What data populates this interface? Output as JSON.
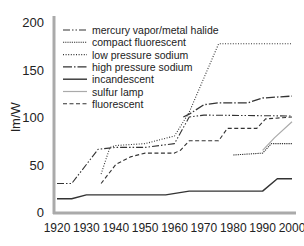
{
  "chart_data": {
    "type": "line",
    "title": "",
    "xlabel": "",
    "ylabel": "lm/W",
    "xlim": [
      1920,
      2000
    ],
    "ylim": [
      0,
      200
    ],
    "x_ticks": [
      1920,
      1930,
      1940,
      1950,
      1960,
      1970,
      1980,
      1990,
      2000
    ],
    "y_ticks": [
      0,
      50,
      100,
      150,
      200
    ],
    "grid": false,
    "legend_position": "upper left",
    "series": [
      {
        "name": "mercury vapor/metal halide",
        "style": "dashdot",
        "color": "#333333",
        "x": [
          1920,
          1925,
          1930,
          1934,
          1940,
          1950,
          1955,
          1960,
          1965,
          1970,
          2000
        ],
        "y": [
          30,
          30,
          50,
          66,
          68,
          68,
          70,
          72,
          100,
          102,
          101
        ]
      },
      {
        "name": "compact fluorescent",
        "style": "densedot",
        "color": "#333333",
        "x": [
          1980,
          1990,
          1993,
          2000
        ],
        "y": [
          60,
          62,
          72,
          72
        ]
      },
      {
        "name": "low pressure sodium",
        "style": "dotted",
        "color": "#333333",
        "x": [
          1935,
          1938,
          1940,
          1950,
          1960,
          1965,
          1975,
          2000
        ],
        "y": [
          40,
          68,
          70,
          72,
          80,
          105,
          177,
          177
        ]
      },
      {
        "name": "high pressure sodium",
        "style": "longdashdot",
        "color": "#333333",
        "x": [
          1963,
          1965,
          1970,
          1975,
          1985,
          1990,
          2000
        ],
        "y": [
          100,
          103,
          113,
          115,
          115,
          120,
          122
        ]
      },
      {
        "name": "incandescent",
        "style": "solid",
        "color": "#333333",
        "x": [
          1920,
          1925,
          1930,
          1940,
          1950,
          1957,
          1965,
          1990,
          1995,
          2000
        ],
        "y": [
          14,
          14,
          18,
          18,
          18,
          18,
          22,
          22,
          35,
          35
        ]
      },
      {
        "name": "sulfur lamp",
        "style": "solid-light",
        "color": "#aaaaaa",
        "x": [
          1990,
          1994,
          2000
        ],
        "y": [
          65,
          78,
          95
        ]
      },
      {
        "name": "fluorescent",
        "style": "dashed",
        "color": "#333333",
        "x": [
          1935,
          1940,
          1945,
          1950,
          1960,
          1962,
          1965,
          1975,
          1978,
          1988,
          1991,
          2000
        ],
        "y": [
          30,
          50,
          58,
          62,
          62,
          65,
          75,
          75,
          88,
          88,
          98,
          100
        ]
      }
    ]
  }
}
